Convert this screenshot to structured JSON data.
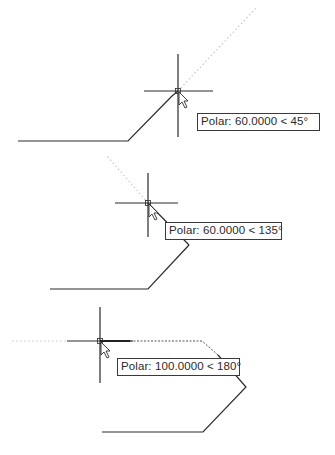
{
  "examples": [
    {
      "tooltip": {
        "label": "Polar",
        "distance": "60.0000",
        "angle": "45°",
        "text": "Polar: 60.0000 < 45°"
      },
      "crosshair": {
        "x": 178,
        "y": 91
      }
    },
    {
      "tooltip": {
        "label": "Polar",
        "distance": "60.0000",
        "angle": "135°",
        "text": "Polar: 60.0000 < 135°"
      },
      "crosshair": {
        "x": 148,
        "y": 203
      }
    },
    {
      "tooltip": {
        "label": "Polar",
        "distance": "100.0000",
        "angle": "180°",
        "text": "Polar: 100.0000 < 180°"
      },
      "crosshair": {
        "x": 100,
        "y": 341
      }
    }
  ],
  "colors": {
    "line": "#2b2b2b",
    "tracking": "#c8c8c8",
    "background": "#ffffff"
  }
}
